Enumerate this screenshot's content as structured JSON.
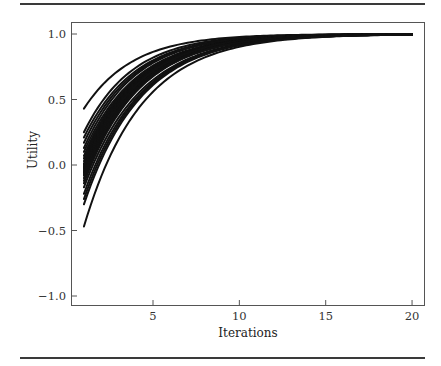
{
  "chart_data": {
    "type": "line",
    "title": "",
    "xlabel": "Iterations",
    "ylabel": "Utility",
    "xlim": [
      0.2,
      20.7
    ],
    "ylim": [
      -1.13,
      1.18
    ],
    "xticks": [
      5,
      10,
      15,
      20
    ],
    "xtick_labels": [
      "5",
      "10",
      "15",
      "20"
    ],
    "yticks": [
      1.0,
      0.5,
      0.0,
      -0.5,
      -1.0
    ],
    "ytick_labels": [
      "1.0",
      "0.5",
      "0.0",
      "−0.5",
      "−1.0"
    ],
    "grid": false,
    "legend": null,
    "line_color": "#111111",
    "x": [
      1,
      2,
      3,
      4,
      5,
      6,
      7,
      8,
      9,
      10,
      11,
      12,
      13,
      14,
      15,
      16,
      17,
      18,
      19,
      20
    ],
    "model": "u(t) = 1 - (1 - u0) * r^(t-1)",
    "series": [
      {
        "name": "run-1",
        "u0": 0.43,
        "r": 0.7
      },
      {
        "name": "run-2",
        "u0": 0.25,
        "r": 0.7
      },
      {
        "name": "run-3",
        "u0": 0.21,
        "r": 0.71
      },
      {
        "name": "run-4",
        "u0": 0.17,
        "r": 0.71
      },
      {
        "name": "run-5",
        "u0": 0.13,
        "r": 0.71
      },
      {
        "name": "run-6",
        "u0": 0.1,
        "r": 0.72
      },
      {
        "name": "run-7",
        "u0": 0.07,
        "r": 0.72
      },
      {
        "name": "run-8",
        "u0": 0.05,
        "r": 0.72
      },
      {
        "name": "run-9",
        "u0": 0.03,
        "r": 0.72
      },
      {
        "name": "run-10",
        "u0": 0.01,
        "r": 0.72
      },
      {
        "name": "run-11",
        "u0": 0.0,
        "r": 0.72
      },
      {
        "name": "run-12",
        "u0": -0.01,
        "r": 0.72
      },
      {
        "name": "run-13",
        "u0": -0.02,
        "r": 0.72
      },
      {
        "name": "run-14",
        "u0": -0.03,
        "r": 0.73
      },
      {
        "name": "run-15",
        "u0": -0.04,
        "r": 0.72
      },
      {
        "name": "run-16",
        "u0": -0.05,
        "r": 0.73
      },
      {
        "name": "run-17",
        "u0": -0.06,
        "r": 0.72
      },
      {
        "name": "run-18",
        "u0": -0.07,
        "r": 0.73
      },
      {
        "name": "run-19",
        "u0": -0.08,
        "r": 0.73
      },
      {
        "name": "run-20",
        "u0": -0.1,
        "r": 0.73
      },
      {
        "name": "run-21",
        "u0": -0.12,
        "r": 0.73
      },
      {
        "name": "run-22",
        "u0": -0.14,
        "r": 0.73
      },
      {
        "name": "run-23",
        "u0": -0.17,
        "r": 0.74
      },
      {
        "name": "run-24",
        "u0": -0.22,
        "r": 0.74
      },
      {
        "name": "run-25",
        "u0": -0.26,
        "r": 0.74
      },
      {
        "name": "run-26",
        "u0": -0.3,
        "r": 0.74
      },
      {
        "name": "run-27",
        "u0": -0.47,
        "r": 0.74
      }
    ]
  }
}
